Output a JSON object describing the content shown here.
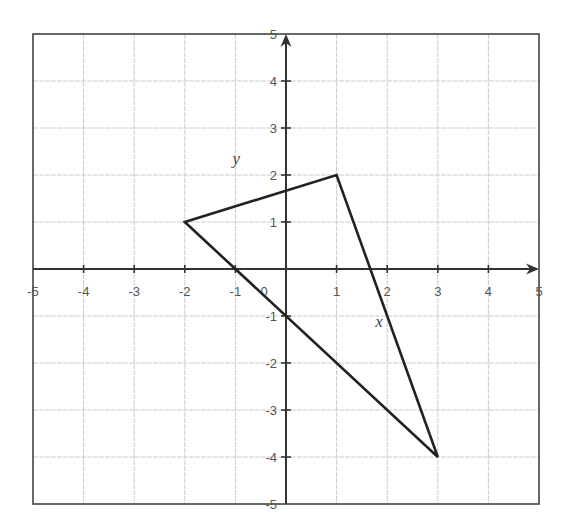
{
  "chart_data": {
    "type": "scatter",
    "title": "",
    "xlabel": "x",
    "ylabel": "y",
    "xlim": [
      -5,
      5
    ],
    "ylim": [
      -5,
      5
    ],
    "grid": true,
    "x_ticks": [
      -5,
      -4,
      -3,
      -2,
      -1,
      0,
      1,
      2,
      3,
      4,
      5
    ],
    "y_ticks": [
      -5,
      -4,
      -3,
      -2,
      -1,
      1,
      2,
      3,
      4,
      5
    ],
    "shapes": [
      {
        "name": "triangle",
        "vertices": [
          [
            -2,
            1
          ],
          [
            1,
            2
          ],
          [
            3,
            -4
          ]
        ],
        "closed": true
      }
    ],
    "annotations": [
      {
        "text": "y",
        "at": [
          -1,
          2.2
        ]
      },
      {
        "text": "x",
        "at": [
          1.9,
          -1.2
        ]
      }
    ]
  },
  "colors": {
    "grid": "#cccccc",
    "axis": "#333333",
    "border": "#444444",
    "shape": "#222222",
    "tick_label": "#555555"
  },
  "labels": {
    "x_var": "x",
    "y_var": "y",
    "origin": "0"
  }
}
